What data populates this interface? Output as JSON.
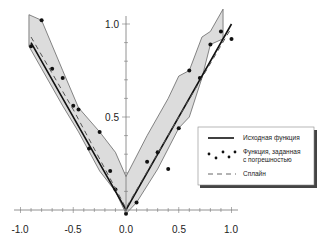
{
  "chart_data": {
    "type": "line",
    "title": "",
    "xlabel": "",
    "ylabel": "",
    "xlim": [
      -1.05,
      1.05
    ],
    "ylim": [
      0,
      1.05
    ],
    "grid": false,
    "legend_position": "lower right",
    "x_ticks": [
      "-1.0",
      "-0.5",
      "0.0",
      "0.5",
      "1.0"
    ],
    "y_ticks": [
      "0.5",
      "1.0"
    ],
    "series": [
      {
        "name": "Исходная функция",
        "style": "solid",
        "x": [
          -0.9,
          0.0,
          1.0
        ],
        "y": [
          0.9,
          0.0,
          1.0
        ]
      },
      {
        "name": "Функция, заданная с погрешностью",
        "style": "markers",
        "x": [
          -0.9,
          -0.8,
          -0.7,
          -0.6,
          -0.5,
          -0.45,
          -0.35,
          -0.25,
          -0.15,
          -0.1,
          0.0,
          0.1,
          0.2,
          0.3,
          0.4,
          0.5,
          0.6,
          0.7,
          0.8,
          0.9,
          1.0
        ],
        "y": [
          0.88,
          1.02,
          0.76,
          0.71,
          0.56,
          0.54,
          0.33,
          0.42,
          0.21,
          0.11,
          -0.02,
          0.04,
          0.26,
          0.31,
          0.22,
          0.44,
          0.75,
          0.71,
          0.89,
          0.96,
          0.92
        ]
      },
      {
        "name": "Сплайн",
        "style": "dashed",
        "x": [
          -0.9,
          -0.5,
          0.0,
          0.5,
          1.0
        ],
        "y": [
          0.93,
          0.54,
          0.01,
          0.5,
          0.98
        ]
      }
    ],
    "band": {
      "name": "error-band",
      "upper": {
        "x": [
          -0.92,
          -0.8,
          -0.6,
          -0.45,
          -0.25,
          -0.1,
          0.0,
          0.2,
          0.4,
          0.5,
          0.6,
          0.72,
          0.8,
          0.92
        ],
        "y": [
          1.05,
          1.02,
          0.75,
          0.55,
          0.42,
          0.31,
          0.18,
          0.4,
          0.6,
          0.72,
          0.75,
          0.93,
          0.96,
          1.08
        ]
      },
      "lower": {
        "x": [
          -0.92,
          -0.8,
          -0.6,
          -0.45,
          -0.25,
          -0.1,
          0.0,
          0.1,
          0.3,
          0.5,
          0.6,
          0.72,
          0.8,
          0.92
        ],
        "y": [
          0.88,
          0.76,
          0.56,
          0.42,
          0.21,
          0.1,
          -0.02,
          0.04,
          0.22,
          0.44,
          0.5,
          0.71,
          0.89,
          0.92
        ]
      }
    }
  },
  "legend": {
    "items": [
      {
        "label": "Исходная функция",
        "style": "solid"
      },
      {
        "label_line1": "Функция, заданная",
        "label_line2": "с погрешностью",
        "style": "markers"
      },
      {
        "label": "Сплайн",
        "style": "dashed"
      }
    ]
  },
  "colors": {
    "line": "#111111",
    "band_fill": "#dcdcdc",
    "band_edge": "#555555",
    "axis": "#777777"
  }
}
